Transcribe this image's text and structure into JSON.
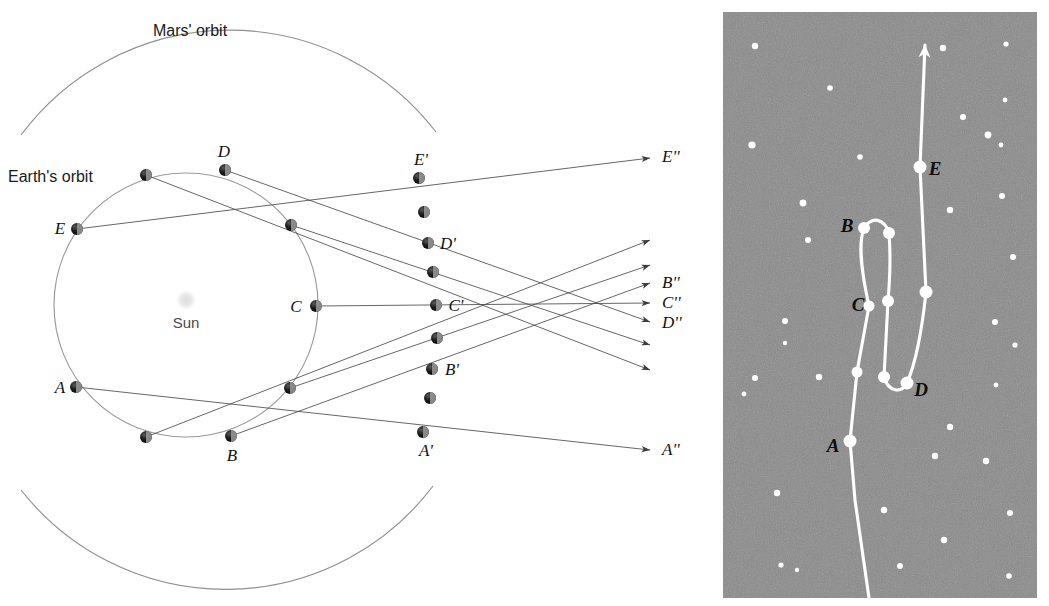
{
  "figure": {
    "title_hidden": "Retrograde motion of Mars",
    "background": "#ffffff"
  },
  "left_panel": {
    "name": "heliocentric-orbit-diagram",
    "labels": {
      "mars_orbit": "Mars' orbit",
      "earth_orbit": "Earth's orbit",
      "sun": "Sun"
    },
    "colors": {
      "orbit_stroke": "#8f8f8f",
      "sightline_stroke": "#4a4a4a",
      "planet_fill": "#1a1a1a",
      "sun_fill": "#e2e2e2",
      "label_text": "#111111"
    },
    "sun": {
      "label": "Sun",
      "x": 186,
      "y": 300,
      "r": 9
    },
    "earth_orbit": {
      "cx": 186,
      "cy": 305,
      "r": 132
    },
    "mars_orbit": {
      "cx": 196,
      "cy": 312,
      "r": 260
    },
    "earth_positions": [
      {
        "label": "A",
        "show_label": true,
        "x": 76,
        "y": 387
      },
      {
        "label": "",
        "show_label": false,
        "x": 146,
        "y": 437
      },
      {
        "label": "B",
        "show_label": true,
        "x": 231,
        "y": 436
      },
      {
        "label": "",
        "show_label": false,
        "x": 290,
        "y": 388
      },
      {
        "label": "C",
        "show_label": true,
        "x": 316,
        "y": 306
      },
      {
        "label": "",
        "show_label": false,
        "x": 291,
        "y": 225
      },
      {
        "label": "D",
        "show_label": true,
        "x": 225,
        "y": 170
      },
      {
        "label": "",
        "show_label": false,
        "x": 146,
        "y": 175
      },
      {
        "label": "E",
        "show_label": true,
        "x": 77,
        "y": 229
      }
    ],
    "mars_positions": [
      {
        "label": "A'",
        "show_label": true,
        "x": 423,
        "y": 432
      },
      {
        "label": "",
        "show_label": false,
        "x": 430,
        "y": 398
      },
      {
        "label": "B'",
        "show_label": true,
        "x": 432,
        "y": 369
      },
      {
        "label": "",
        "show_label": false,
        "x": 437,
        "y": 338
      },
      {
        "label": "C'",
        "show_label": true,
        "x": 436,
        "y": 305
      },
      {
        "label": "",
        "show_label": false,
        "x": 433,
        "y": 272
      },
      {
        "label": "D'",
        "show_label": true,
        "x": 428,
        "y": 243
      },
      {
        "label": "",
        "show_label": false,
        "x": 424,
        "y": 212
      },
      {
        "label": "E'",
        "show_label": true,
        "x": 419,
        "y": 178
      }
    ],
    "sky_projection_labels": [
      {
        "label": "E''",
        "x": 662,
        "y": 162
      },
      {
        "label": "B''",
        "x": 662,
        "y": 288
      },
      {
        "label": "C''",
        "x": 662,
        "y": 308
      },
      {
        "label": "D''",
        "x": 662,
        "y": 328
      },
      {
        "label": "A''",
        "x": 662,
        "y": 455
      }
    ],
    "sight_lines": [
      {
        "name": "sightline-A",
        "from": "A",
        "x1": 76,
        "y1": 387,
        "x2": 650,
        "y2": 450
      },
      {
        "name": "sightline-B",
        "from": "B",
        "x1": 231,
        "y1": 436,
        "x2": 650,
        "y2": 283
      },
      {
        "name": "sightline-C",
        "from": "C",
        "x1": 316,
        "y1": 306,
        "x2": 650,
        "y2": 303
      },
      {
        "name": "sightline-D",
        "from": "D",
        "x1": 225,
        "y1": 170,
        "x2": 650,
        "y2": 322
      },
      {
        "name": "sightline-E",
        "from": "E",
        "x1": 77,
        "y1": 229,
        "x2": 650,
        "y2": 158
      },
      {
        "name": "sightline-2",
        "from": "e2",
        "x1": 146,
        "y1": 437,
        "x2": 650,
        "y2": 240
      },
      {
        "name": "sightline-4",
        "from": "e4",
        "x1": 290,
        "y1": 388,
        "x2": 650,
        "y2": 265
      },
      {
        "name": "sightline-6",
        "from": "e6",
        "x1": 291,
        "y1": 225,
        "x2": 650,
        "y2": 345
      },
      {
        "name": "sightline-8",
        "from": "e8",
        "x1": 146,
        "y1": 175,
        "x2": 650,
        "y2": 370
      }
    ]
  },
  "right_panel": {
    "name": "sky-view-starfield",
    "colors": {
      "sky_fill": "#8c8c8c",
      "star_fill": "#ffffff",
      "track_stroke": "#ffffff",
      "label_text": "#0d0d0d"
    },
    "frame": {
      "x": 723,
      "y": 12,
      "width": 314,
      "height": 586
    },
    "track_labels": [
      {
        "label": "E",
        "x": 935,
        "y": 175
      },
      {
        "label": "B",
        "x": 847,
        "y": 232
      },
      {
        "label": "C",
        "x": 858,
        "y": 311
      },
      {
        "label": "D",
        "x": 921,
        "y": 396
      },
      {
        "label": "A",
        "x": 833,
        "y": 452
      }
    ],
    "track_nodes": [
      {
        "label": "A",
        "x": 850,
        "y": 441,
        "r": 6.5
      },
      {
        "label": "",
        "x": 857,
        "y": 372,
        "r": 5.5
      },
      {
        "label": "C",
        "x": 869,
        "y": 306,
        "r": 5.5
      },
      {
        "label": "B",
        "x": 864,
        "y": 228,
        "r": 6.0
      },
      {
        "label": "",
        "x": 889,
        "y": 233,
        "r": 6.0
      },
      {
        "label": "",
        "x": 888,
        "y": 301,
        "r": 6.0
      },
      {
        "label": "",
        "x": 884,
        "y": 377,
        "r": 6.0
      },
      {
        "label": "D",
        "x": 907,
        "y": 383,
        "r": 6.5
      },
      {
        "label": "",
        "x": 926,
        "y": 292,
        "r": 6.5
      },
      {
        "label": "E",
        "x": 920,
        "y": 167,
        "r": 6.5
      },
      {
        "label": "",
        "x": 925,
        "y": 67,
        "r": 0.0
      }
    ],
    "stars": [
      {
        "x": 755,
        "y": 46,
        "r": 3.2
      },
      {
        "x": 943,
        "y": 48,
        "r": 3.2
      },
      {
        "x": 1006,
        "y": 44,
        "r": 2.6
      },
      {
        "x": 830,
        "y": 88,
        "r": 2.8
      },
      {
        "x": 1005,
        "y": 100,
        "r": 2.4
      },
      {
        "x": 752,
        "y": 145,
        "r": 3.6
      },
      {
        "x": 860,
        "y": 157,
        "r": 2.8
      },
      {
        "x": 963,
        "y": 117,
        "r": 3.0
      },
      {
        "x": 988,
        "y": 135,
        "r": 3.4
      },
      {
        "x": 1001,
        "y": 145,
        "r": 2.4
      },
      {
        "x": 803,
        "y": 203,
        "r": 3.4
      },
      {
        "x": 1002,
        "y": 196,
        "r": 3.0
      },
      {
        "x": 950,
        "y": 210,
        "r": 3.2
      },
      {
        "x": 808,
        "y": 240,
        "r": 3.0
      },
      {
        "x": 1013,
        "y": 257,
        "r": 3.0
      },
      {
        "x": 785,
        "y": 321,
        "r": 3.0
      },
      {
        "x": 785,
        "y": 343,
        "r": 2.2
      },
      {
        "x": 819,
        "y": 377,
        "r": 3.2
      },
      {
        "x": 755,
        "y": 378,
        "r": 3.0
      },
      {
        "x": 744,
        "y": 394,
        "r": 2.4
      },
      {
        "x": 995,
        "y": 322,
        "r": 3.0
      },
      {
        "x": 1015,
        "y": 345,
        "r": 2.6
      },
      {
        "x": 996,
        "y": 385,
        "r": 2.4
      },
      {
        "x": 950,
        "y": 427,
        "r": 3.2
      },
      {
        "x": 935,
        "y": 456,
        "r": 3.2
      },
      {
        "x": 986,
        "y": 461,
        "r": 3.2
      },
      {
        "x": 777,
        "y": 493,
        "r": 3.2
      },
      {
        "x": 884,
        "y": 510,
        "r": 3.2
      },
      {
        "x": 1010,
        "y": 513,
        "r": 3.0
      },
      {
        "x": 944,
        "y": 540,
        "r": 3.2
      },
      {
        "x": 781,
        "y": 565,
        "r": 2.6
      },
      {
        "x": 797,
        "y": 570,
        "r": 2.2
      },
      {
        "x": 900,
        "y": 566,
        "r": 3.0
      },
      {
        "x": 1009,
        "y": 576,
        "r": 2.8
      }
    ]
  }
}
